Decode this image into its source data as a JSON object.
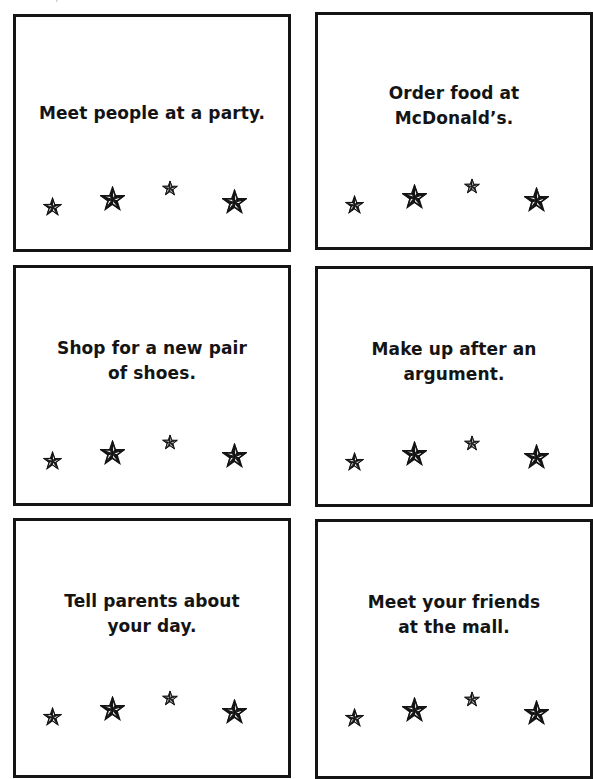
{
  "page": {
    "type": "activity-cards",
    "star_icon": "nautical-star-icon",
    "border_color": "#141414",
    "text_color": "#141414"
  },
  "cards": [
    {
      "text": "Meet people at a party.",
      "stars_per_card": 4
    },
    {
      "text": "Order food at McDonald’s.",
      "stars_per_card": 4
    },
    {
      "text": "Shop for a new pair of shoes.",
      "stars_per_card": 4
    },
    {
      "text": "Make up after an argument.",
      "stars_per_card": 4
    },
    {
      "text": "Tell parents about your day.",
      "stars_per_card": 4
    },
    {
      "text": "Meet your friends at the mall.",
      "stars_per_card": 4
    }
  ],
  "card_lines": [
    [
      "Meet people at a party."
    ],
    [
      "Order food at",
      "McDonald’s."
    ],
    [
      "Shop for a new pair",
      "of shoes."
    ],
    [
      "Make up after an",
      "argument."
    ],
    [
      "Tell parents about",
      "your day."
    ],
    [
      "Meet your friends",
      "at the mall."
    ]
  ]
}
